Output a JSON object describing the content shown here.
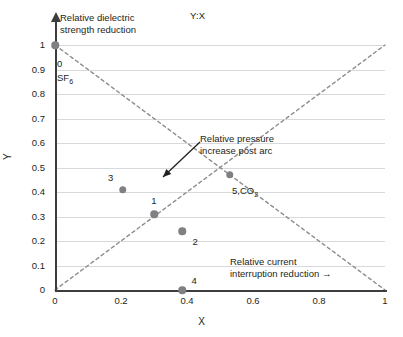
{
  "chart_data": {
    "type": "scatter",
    "title": "Y:X",
    "xlabel": "X",
    "ylabel": "Y",
    "xlim": [
      0,
      1
    ],
    "ylim": [
      0,
      1
    ],
    "grid": true,
    "legend": "none",
    "xticks": [
      "0",
      "0.2",
      "0.4",
      "0.6",
      "0.8",
      "1"
    ],
    "xtick_values": [
      0,
      0.2,
      0.4,
      0.6,
      0.8,
      1
    ],
    "yticks": [
      "0",
      "0.1",
      "0.2",
      "0.3",
      "0.4",
      "0.5",
      "0.6",
      "0.7",
      "0.8",
      "0.9",
      "1"
    ],
    "ytick_values": [
      0,
      0.1,
      0.2,
      0.3,
      0.4,
      0.5,
      0.6,
      0.7,
      0.8,
      0.9,
      1
    ],
    "points": [
      {
        "id": "0",
        "label": "0",
        "x": 0.0,
        "y": 1.0,
        "label_dx": 8,
        "label_dy": 14
      },
      {
        "id": "3",
        "label": "3",
        "x": 0.205,
        "y": 0.41,
        "label_dx": -12,
        "label_dy": -13
      },
      {
        "id": "1",
        "label": "1",
        "x": 0.3,
        "y": 0.31,
        "label_dx": 0,
        "label_dy": -14
      },
      {
        "id": "2",
        "label": "2",
        "x": 0.385,
        "y": 0.24,
        "label_dx": 13,
        "label_dy": 10
      },
      {
        "id": "4",
        "label": "4",
        "x": 0.385,
        "y": 0.0,
        "label_dx": 12,
        "label_dy": -10
      },
      {
        "id": "5",
        "label": "5",
        "x": 0.53,
        "y": 0.47,
        "label_dx": 14,
        "label_dy": 13
      }
    ],
    "point_color": "#7e8083",
    "gridline_color": "#d7d9dc",
    "axis_color": "#3d3d3f",
    "trendline_color": "#8a8c8f",
    "trendlines": [
      {
        "name": "descending",
        "from": [
          0,
          1
        ],
        "to": [
          1,
          0
        ],
        "style": "dashed"
      },
      {
        "name": "ascending",
        "from": [
          0,
          0
        ],
        "to": [
          1,
          1
        ],
        "style": "dashed"
      }
    ],
    "series_note": "Point 0 is SF6; point 5 is CO2"
  },
  "labels": {
    "sf6_index": "0",
    "sf6_name": "SF",
    "sf6_sub": "6",
    "co2_point": "5,",
    "co2_name": "CO",
    "co2_sub": "2"
  },
  "annotations": {
    "dielectric": "Relative dielectric\nstrength reduction",
    "pressure": "Relative pressure\nincrease post arc",
    "current": "Relative current\ninterruption reduction →"
  },
  "arrow": {
    "name": "pressure-annotation-arrow",
    "from_px": [
      200,
      142
    ],
    "to_px": [
      163,
      177
    ]
  }
}
